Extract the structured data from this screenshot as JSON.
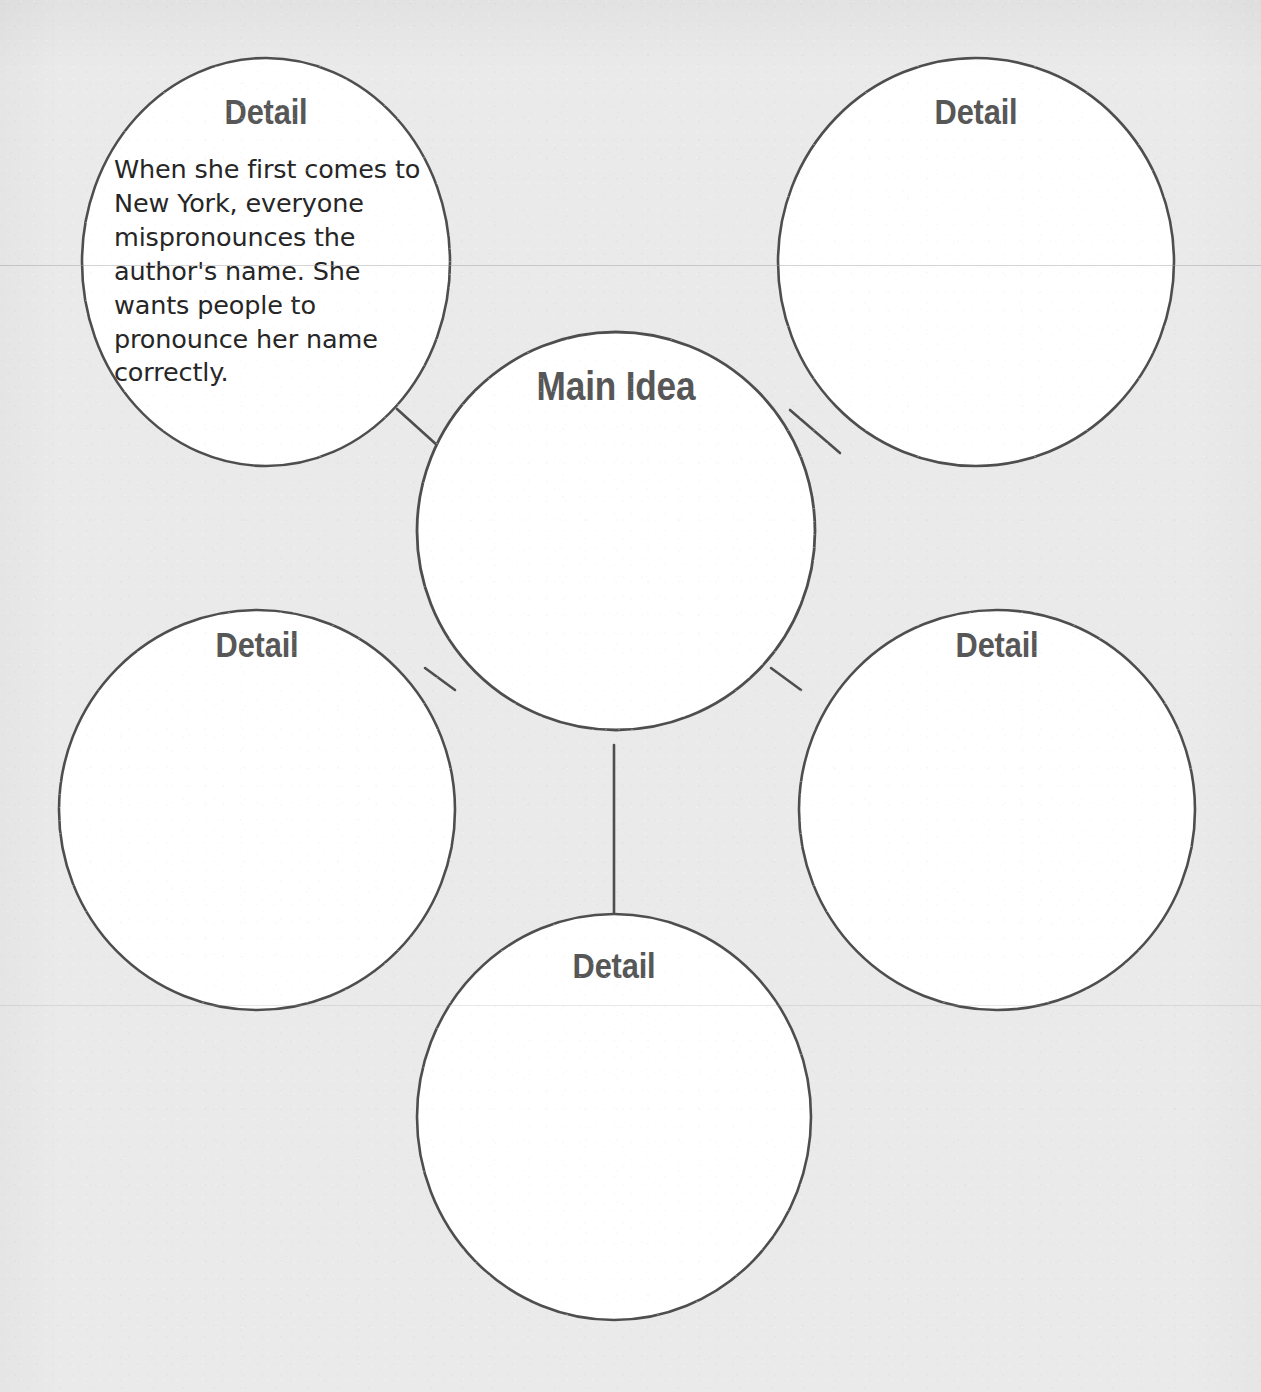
{
  "worksheet": {
    "background_color": "#eaeaea",
    "circle_fill": "#ffffff",
    "circle_stroke": "#4e4e4e",
    "label_color": "#575757",
    "body_text_color": "#262626"
  },
  "center_node": {
    "id": "main-idea",
    "label": "Main Idea",
    "text": "",
    "cx": 616,
    "cy": 531,
    "r": 199
  },
  "detail_nodes": [
    {
      "id": "detail-top-left",
      "label": "Detail",
      "text": "When she first comes to New York, everyone mispronounces the author's name. She wants people to pronounce her name correctly.",
      "filled": true,
      "cx": 266,
      "cy": 262,
      "r": 186
    },
    {
      "id": "detail-top-right",
      "label": "Detail",
      "text": "",
      "filled": false,
      "cx": 976,
      "cy": 262,
      "r": 198
    },
    {
      "id": "detail-left",
      "label": "Detail",
      "text": "",
      "filled": false,
      "cx": 257,
      "cy": 810,
      "r": 198
    },
    {
      "id": "detail-right",
      "label": "Detail",
      "text": "",
      "filled": false,
      "cx": 997,
      "cy": 810,
      "r": 198
    },
    {
      "id": "detail-bottom",
      "label": "Detail",
      "text": "",
      "filled": false,
      "cx": 614,
      "cy": 1117,
      "r": 198
    }
  ],
  "connectors": [
    {
      "id": "connector-top-left",
      "x1": 397,
      "y1": 409,
      "x2": 448,
      "y2": 455
    },
    {
      "id": "connector-top-right",
      "x1": 790,
      "y1": 410,
      "x2": 840,
      "y2": 453
    },
    {
      "id": "connector-left",
      "x1": 425,
      "y1": 668,
      "x2": 455,
      "y2": 690
    },
    {
      "id": "connector-right",
      "x1": 771,
      "y1": 668,
      "x2": 801,
      "y2": 690
    },
    {
      "id": "connector-bottom",
      "x1": 614,
      "y1": 745,
      "x2": 614,
      "y2": 914
    }
  ],
  "scan_artifacts": {
    "line_y_top": 265,
    "line_y_bottom": 1005
  }
}
